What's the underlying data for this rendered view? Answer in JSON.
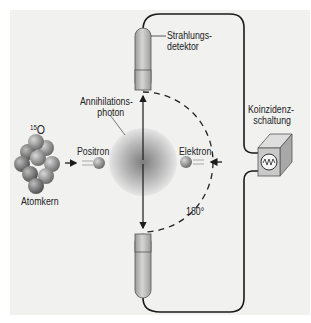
{
  "labels": {
    "isotope_mass": "15",
    "isotope_symbol": "O",
    "nucleus": "Atomkern",
    "positron": "Positron",
    "electron": "Elektron",
    "annihilation_photon_line1": "Annihilations-",
    "annihilation_photon_line2": "photon",
    "detector_line1": "Strahlungs-",
    "detector_line2": "detektor",
    "coincidence_line1": "Koinzidenz-",
    "coincidence_line2": "schaltung",
    "angle": "180°"
  },
  "colors": {
    "background": "#f1f1f0",
    "wire": "#1a1a1a",
    "detector_body": "#b8b8b8",
    "sphere_core": "#8a8a8a",
    "box_face": "#c9c9c9"
  }
}
